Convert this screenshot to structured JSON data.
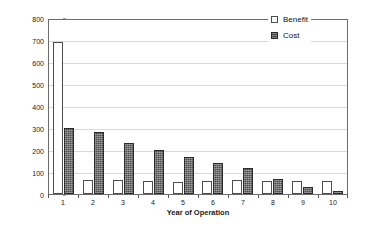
{
  "chart_data": {
    "type": "bar",
    "title": "",
    "subtitle": "",
    "xlabel": "Year of Operation",
    "ylabel": "$/kW Present Worth",
    "categories": [
      "1",
      "2",
      "3",
      "4",
      "5",
      "6",
      "7",
      "8",
      "9",
      "10"
    ],
    "series": [
      {
        "name": "Benefit",
        "values": [
          690,
          65,
          62,
          58,
          55,
          60,
          62,
          60,
          58,
          57
        ],
        "fill": "#ffffff",
        "stroke": "#4d4d4d"
      },
      {
        "name": "Cost",
        "values": [
          300,
          282,
          233,
          202,
          168,
          140,
          118,
          68,
          30,
          15
        ],
        "fill": "#4a4a4a",
        "stroke": "#2b2b2b"
      }
    ],
    "ylim": [
      0,
      800
    ],
    "ytick_values": [
      0,
      100,
      200,
      300,
      400,
      500,
      600,
      700,
      800
    ],
    "ytick_labels": [
      "0",
      "100",
      "200",
      "300",
      "400",
      "500",
      "600",
      "700",
      "800"
    ],
    "grid": true,
    "grid_axis": "y",
    "grid_color": "#d9d9d9",
    "legend": {
      "position": "top-right-inside",
      "entries": [
        {
          "label": "Benefit",
          "swatch": "hollow-square-icon"
        },
        {
          "label": "Cost",
          "swatch": "filled-square-icon"
        }
      ]
    },
    "plot_border_color": "#6b6b6b",
    "background": "#ffffff"
  }
}
